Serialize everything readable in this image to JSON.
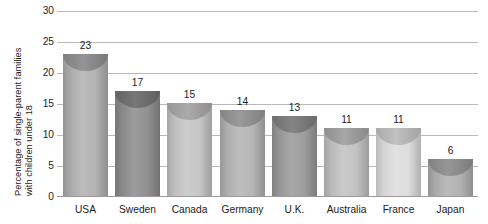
{
  "chart_data": {
    "type": "bar",
    "title": "",
    "subtitle": "",
    "xlabel": "",
    "ylabel": "Percentage of single-parent families with children under 18",
    "ylabel_lines": [
      "Percentage of single-parent families",
      "with children under 18"
    ],
    "categories": [
      "USA",
      "Sweden",
      "Canada",
      "Germany",
      "U.K.",
      "Australia",
      "France",
      "Japan"
    ],
    "values": [
      23,
      17,
      15,
      14,
      13,
      11,
      11,
      6
    ],
    "value_labels": [
      "23",
      "17",
      "15",
      "14",
      "13",
      "11",
      "11",
      "6"
    ],
    "ylim": [
      0,
      30
    ],
    "ytick_values": [
      0,
      5,
      10,
      15,
      20,
      25,
      30
    ],
    "ytick_labels": [
      "0",
      "5",
      "10",
      "15",
      "20",
      "25",
      "30"
    ],
    "grid": true,
    "legend": false,
    "legend_position": "none",
    "bar_style": "cylinder",
    "bar_colors": [
      "#b1b1b1",
      "#8e8e8e",
      "#c6c6c6",
      "#b4b4b4",
      "#9b9b9b",
      "#c2c2c2",
      "#dcdcdc",
      "#b0b0b0"
    ],
    "bar_cap_colors": [
      "#8d8d8d",
      "#6e6e6e",
      "#a6a6a6",
      "#949494",
      "#7c7c7c",
      "#a0a0a0",
      "#bdbdbd",
      "#8f8f8f"
    ],
    "grid_color": "#b9b9b9",
    "axis_color": "#9a9a9a",
    "text_color": "#1c1c1c",
    "background_color": "#ffffff"
  }
}
